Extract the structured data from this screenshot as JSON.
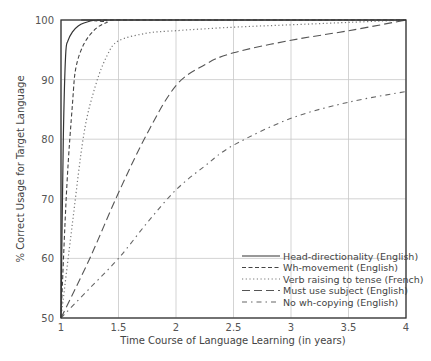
{
  "chart_data": {
    "type": "line",
    "title": "",
    "xlabel": "Time Course of Language Learning (in years)",
    "ylabel": "% Correct Usage for Target Language",
    "xlim": [
      1,
      4
    ],
    "ylim": [
      50,
      100
    ],
    "xticks": [
      "1",
      "1.5",
      "2",
      "2.5",
      "3",
      "3.5",
      "4"
    ],
    "yticks": [
      "50",
      "60",
      "70",
      "80",
      "90",
      "100"
    ],
    "grid": true,
    "legend_position": "lower right",
    "series": [
      {
        "name": "Head-directionality (English)",
        "style": "solid",
        "x": [
          1.0,
          1.02,
          1.04,
          1.06,
          1.1,
          1.15,
          1.2,
          1.3,
          1.4,
          4.0
        ],
        "y": [
          50,
          80,
          94,
          96.5,
          98,
          99,
          99.5,
          100,
          100,
          100
        ]
      },
      {
        "name": "Wh-movement (English)",
        "style": "dashed",
        "x": [
          1.0,
          1.05,
          1.1,
          1.13,
          1.2,
          1.3,
          1.4,
          1.5,
          4.0
        ],
        "y": [
          50,
          72,
          86,
          92,
          96,
          98.5,
          99.6,
          100,
          100
        ]
      },
      {
        "name": "Verb raising to tense (French)",
        "style": "dotted",
        "x": [
          1.0,
          1.1,
          1.2,
          1.3,
          1.4,
          1.5,
          1.75,
          2.0,
          2.5,
          3.0,
          3.5,
          4.0
        ],
        "y": [
          50,
          66,
          81,
          89,
          94,
          96.5,
          97.8,
          98.2,
          98.8,
          99.2,
          99.6,
          100
        ]
      },
      {
        "name": "Must use subject (English)",
        "style": "long-dashed",
        "x": [
          1.0,
          1.25,
          1.5,
          1.75,
          2.0,
          2.25,
          2.5,
          3.0,
          3.5,
          4.0
        ],
        "y": [
          50,
          60,
          71,
          81,
          89,
          92.5,
          94.5,
          96.6,
          98.2,
          100
        ]
      },
      {
        "name": "No wh-copying (English)",
        "style": "dash-dot",
        "x": [
          1.0,
          1.25,
          1.5,
          1.75,
          2.0,
          2.25,
          2.5,
          3.0,
          3.5,
          4.0
        ],
        "y": [
          50,
          55,
          60,
          66,
          71.5,
          75.5,
          79,
          83.5,
          86.2,
          88
        ]
      }
    ]
  }
}
